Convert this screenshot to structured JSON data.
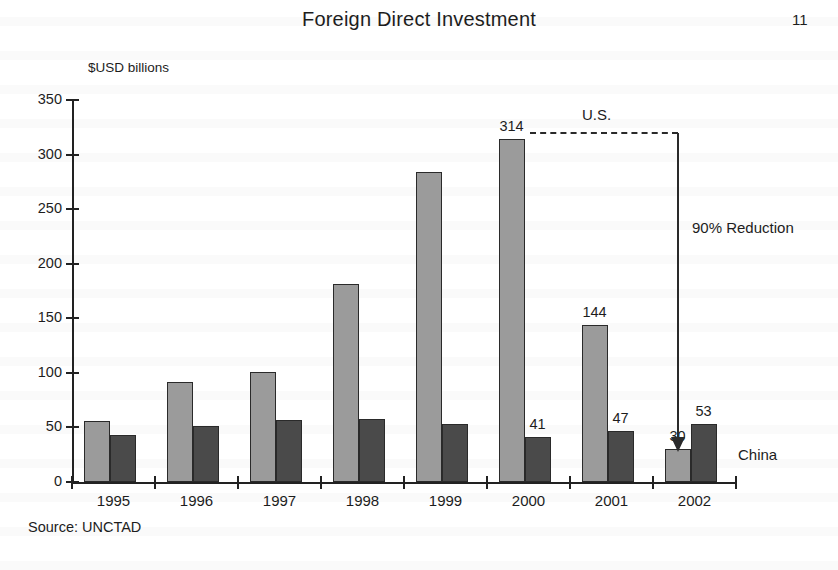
{
  "document": {
    "title": "Foreign Direct Investment",
    "page_number": "11",
    "source_note": "Source: UNCTAD"
  },
  "chart_data": {
    "type": "bar",
    "title": "Foreign Direct Investment",
    "xlabel": "",
    "ylabel": "$USD billions",
    "ylim": [
      0,
      350
    ],
    "ytick_labels": [
      "350",
      "300",
      "250",
      "200",
      "150",
      "100",
      "50",
      "0"
    ],
    "ytick_values": [
      350,
      300,
      250,
      200,
      150,
      100,
      50,
      0
    ],
    "grid": false,
    "legend_position": "inline-annotations",
    "categories": [
      "1995",
      "1996",
      "1997",
      "1998",
      "1999",
      "2000",
      "2001",
      "2002"
    ],
    "series": [
      {
        "name": "U.S.",
        "color": "#9b9b9b",
        "values": [
          56,
          92,
          101,
          181,
          284,
          314,
          144,
          30
        ],
        "value_labels": [
          "",
          "",
          "",
          "",
          "",
          "314",
          "144",
          "30"
        ]
      },
      {
        "name": "China",
        "color": "#4a4a4a",
        "values": [
          43,
          51,
          57,
          58,
          53,
          41,
          47,
          53
        ],
        "value_labels": [
          "",
          "",
          "",
          "",
          "",
          "41",
          "47",
          "53"
        ]
      }
    ],
    "annotations": [
      {
        "id": "us-series-label",
        "text": "U.S."
      },
      {
        "id": "china-series-label",
        "text": "China"
      },
      {
        "id": "reduction-callout",
        "text": "90% Reduction"
      }
    ]
  }
}
